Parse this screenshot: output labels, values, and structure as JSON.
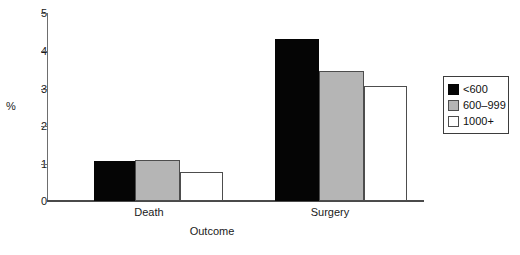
{
  "chart_data": {
    "type": "bar",
    "title": "",
    "subtitle": "",
    "xlabel": "Outcome",
    "ylabel": "%",
    "categories": [
      "Death",
      "Surgery"
    ],
    "series": [
      {
        "name": "<600",
        "color": "#050505",
        "values": [
          1.07,
          4.32
        ]
      },
      {
        "name": "600–999",
        "color": "#b5b5b5",
        "values": [
          1.1,
          3.46
        ]
      },
      {
        "name": "1000+",
        "color": "#ffffff",
        "values": [
          0.78,
          3.05
        ]
      }
    ],
    "ylim": [
      0,
      5
    ],
    "ytick_labels": [
      "0",
      "1",
      "2",
      "3",
      "4",
      "5"
    ],
    "ytick_values": [
      0,
      1,
      2,
      3,
      4,
      5
    ],
    "grid": false,
    "legend_position": "right",
    "annotations": []
  },
  "axes": {
    "y_label": "%",
    "x_label": "Outcome",
    "y_ticks": [
      "5",
      "4",
      "3",
      "2",
      "1",
      "0"
    ]
  },
  "legend": {
    "entries": [
      {
        "label": "<600",
        "swatch": "black"
      },
      {
        "label": "600–999",
        "swatch": "gray"
      },
      {
        "label": "1000+",
        "swatch": "white"
      }
    ]
  },
  "groups": [
    {
      "label": "Death"
    },
    {
      "label": "Surgery"
    }
  ],
  "colors": {
    "black": "#050505",
    "gray": "#b5b5b5",
    "white": "#ffffff",
    "axis": "#4a4a4a",
    "text": "#1a1a1a"
  }
}
